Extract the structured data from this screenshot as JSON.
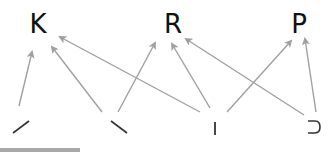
{
  "diagram": {
    "letters": [
      {
        "id": "K",
        "label": "K",
        "x": 38,
        "y": 10
      },
      {
        "id": "R",
        "label": "R",
        "x": 173,
        "y": 10
      },
      {
        "id": "P",
        "label": "P",
        "x": 299,
        "y": 10
      }
    ],
    "components": [
      {
        "id": "slash",
        "label": "/",
        "name": "forward-slash-stroke"
      },
      {
        "id": "backslash",
        "label": "\\",
        "name": "backslash-stroke"
      },
      {
        "id": "vertical",
        "label": "|",
        "name": "vertical-stroke"
      },
      {
        "id": "hook",
        "label": "⊃",
        "name": "hook-stroke"
      }
    ],
    "edges": [
      {
        "from": "slash",
        "to": "K"
      },
      {
        "from": "backslash",
        "to": "K"
      },
      {
        "from": "backslash",
        "to": "R"
      },
      {
        "from": "vertical",
        "to": "K"
      },
      {
        "from": "vertical",
        "to": "R"
      },
      {
        "from": "vertical",
        "to": "P"
      },
      {
        "from": "hook",
        "to": "R"
      },
      {
        "from": "hook",
        "to": "P"
      }
    ],
    "colors": {
      "arrow": "#a0a0a0",
      "text": "#111111",
      "stroke": "#333333",
      "bar": "#a8a8a8"
    }
  }
}
